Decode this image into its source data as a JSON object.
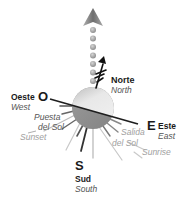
{
  "diagram": {
    "north": {
      "letter": "N",
      "es": "Norte",
      "en": "North"
    },
    "west": {
      "letter": "O",
      "es": "Oeste",
      "en": "West"
    },
    "east": {
      "letter": "E",
      "es": "Este",
      "en": "East"
    },
    "south": {
      "letter": "S",
      "es": "Sud",
      "en": "South"
    },
    "sunset": {
      "es_line1": "Puesta",
      "es_line2": "del Sol",
      "en": "Sunset"
    },
    "sunrise": {
      "es_line1": "Salida",
      "es_line2": "del Sol",
      "en": "Sunrise"
    }
  },
  "colors": {
    "arrow": "#8a8a8a",
    "dots": "#9a9a9a",
    "sphere_top": "#d8d8d8",
    "sphere_bottom": "#8c8c8c",
    "horizon_line": "#222222",
    "rays_dark": "#444444",
    "rays_light": "#bbbbbb"
  }
}
